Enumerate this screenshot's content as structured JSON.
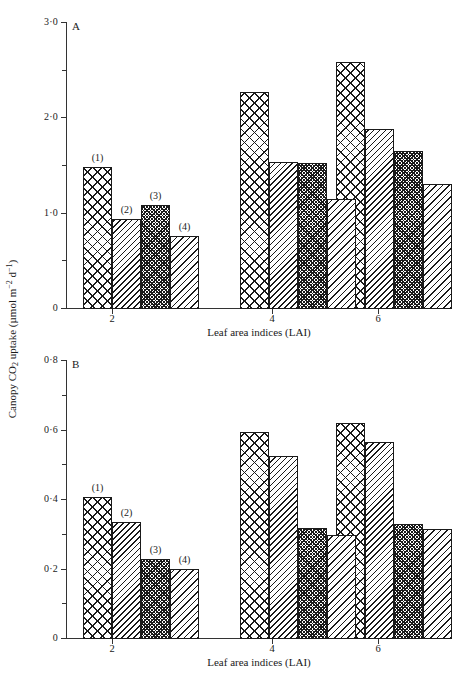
{
  "figure": {
    "y_axis_label": "Canopy CO2 uptake (µmol m-2 d-1)",
    "y_axis_label_parts": {
      "prefix": "Canopy CO",
      "sub": "2",
      "mid": " uptake (",
      "unit_mol": "µmol m",
      "sup1": "−2",
      "unit_d": " d",
      "sup2": "−1",
      "close": ")"
    },
    "x_axis_title": "Leaf area indices (LAI)"
  },
  "chart_data": [
    {
      "type": "bar",
      "panel": "A",
      "title": "A",
      "xlabel": "Leaf area indices (LAI)",
      "ylabel": "Canopy CO2 uptake (µmol m−2 d−1)",
      "categories": [
        "2",
        "4",
        "6"
      ],
      "x_tick_labels": [
        "2",
        "4",
        "6"
      ],
      "y_tick_labels": [
        "0",
        "1·0",
        "2·0",
        "3·0"
      ],
      "y_tick_values": [
        0,
        1.0,
        2.0,
        3.0
      ],
      "y_minor_tick_values": [
        0.5,
        1.5,
        2.5
      ],
      "ylim": [
        0,
        3.0
      ],
      "grid": false,
      "legend": "none",
      "series": [
        {
          "name": "(1)",
          "label": "(1)",
          "pattern": "coarse-cross-hatch",
          "values": [
            1.48,
            2.27,
            2.58
          ]
        },
        {
          "name": "(2)",
          "label": "(2)",
          "pattern": "diagonal-hatch",
          "values": [
            0.93,
            1.53,
            1.88
          ]
        },
        {
          "name": "(3)",
          "label": "(3)",
          "pattern": "fine-dense-cross-hatch",
          "values": [
            1.08,
            1.52,
            1.65
          ]
        },
        {
          "name": "(4)",
          "label": "(4)",
          "pattern": "diagonal-hatch-wide",
          "values": [
            0.76,
            1.14,
            1.3
          ]
        }
      ],
      "annotations": [
        {
          "text": "(1)",
          "group": "2",
          "series": "(1)"
        },
        {
          "text": "(2)",
          "group": "2",
          "series": "(2)"
        },
        {
          "text": "(3)",
          "group": "2",
          "series": "(3)"
        },
        {
          "text": "(4)",
          "group": "2",
          "series": "(4)"
        }
      ]
    },
    {
      "type": "bar",
      "panel": "B",
      "title": "B",
      "xlabel": "Leaf area indices (LAI)",
      "ylabel": "Canopy CO2 uptake (µmol m−2 d−1)",
      "categories": [
        "2",
        "4",
        "6"
      ],
      "x_tick_labels": [
        "2",
        "4",
        "6"
      ],
      "y_tick_labels": [
        "0",
        "0·2",
        "0·4",
        "0·6",
        "0·8"
      ],
      "y_tick_values": [
        0,
        0.2,
        0.4,
        0.6,
        0.8
      ],
      "y_minor_tick_values": [
        0.1,
        0.3,
        0.5,
        0.7
      ],
      "ylim": [
        0,
        0.8
      ],
      "grid": false,
      "legend": "none",
      "series": [
        {
          "name": "(1)",
          "label": "(1)",
          "pattern": "coarse-cross-hatch",
          "values": [
            0.405,
            0.593,
            0.62
          ]
        },
        {
          "name": "(2)",
          "label": "(2)",
          "pattern": "diagonal-hatch",
          "values": [
            0.333,
            0.525,
            0.565
          ]
        },
        {
          "name": "(3)",
          "label": "(3)",
          "pattern": "fine-dense-cross-hatch",
          "values": [
            0.227,
            0.316,
            0.327
          ]
        },
        {
          "name": "(4)",
          "label": "(4)",
          "pattern": "diagonal-hatch-wide",
          "values": [
            0.2,
            0.296,
            0.313
          ]
        }
      ],
      "annotations": [
        {
          "text": "(1)",
          "group": "2",
          "series": "(1)"
        },
        {
          "text": "(2)",
          "group": "2",
          "series": "(2)"
        },
        {
          "text": "(3)",
          "group": "2",
          "series": "(3)"
        },
        {
          "text": "(4)",
          "group": "2",
          "series": "(4)"
        }
      ]
    }
  ]
}
